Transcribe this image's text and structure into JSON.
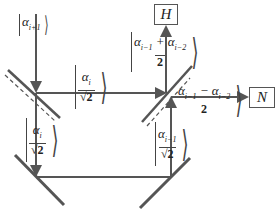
{
  "diagram": {
    "type": "optical-interferometer",
    "colors": {
      "beam": "#555555",
      "mirror": "#555555",
      "background": "#ffffff"
    },
    "outputs": {
      "top": {
        "label": "H"
      },
      "right": {
        "label": "N"
      }
    },
    "states": {
      "input": {
        "symbol": "α",
        "sub": "i+1"
      },
      "transmitted_horizontal": {
        "symbol": "α",
        "sub": "i",
        "den": "√2"
      },
      "reflected_down_left": {
        "symbol": "α",
        "sub": "i",
        "den": "√2"
      },
      "right_vertical": {
        "symbol": "α",
        "sub": "i−1",
        "den": "√2"
      },
      "output_H": {
        "a": "α",
        "a_sub": "i−1",
        "op": "+",
        "b": "α",
        "b_sub": "i−2",
        "den": "2"
      },
      "output_N": {
        "a": "α",
        "a_sub": "i−1",
        "op": "−",
        "b": "α",
        "b_sub": "i−2",
        "den": "2"
      }
    },
    "components": [
      "beam-splitter-left",
      "beam-splitter-right",
      "mirror-bottom-left",
      "mirror-bottom-right"
    ]
  }
}
